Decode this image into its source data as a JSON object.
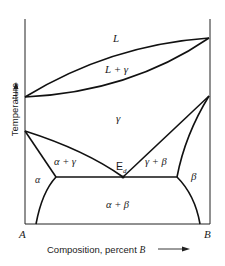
{
  "diagram": {
    "type": "binary phase diagram (eutectoid)",
    "axes": {
      "y_label": "Temperature",
      "y_arrow": "up",
      "x_label_prefix": "Composition, percent ",
      "x_label_var": "B",
      "x_arrow": "right",
      "left_end": "A",
      "right_end": "B"
    },
    "regions": {
      "liquid": "L",
      "liquid_gamma": "L + γ",
      "gamma": "γ",
      "alpha_gamma": "α + γ",
      "gamma_beta": "γ + β",
      "alpha": "α",
      "beta": "β",
      "alpha_beta": "α + β"
    },
    "points": {
      "eutectoid": "E",
      "eutectoid_sub": "d"
    }
  }
}
